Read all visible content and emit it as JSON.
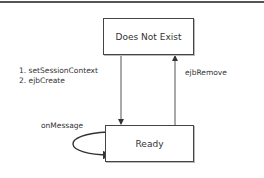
{
  "diagram": {
    "type": "state-diagram",
    "states": [
      {
        "id": "does-not-exist",
        "label": "Does Not Exist"
      },
      {
        "id": "ready",
        "label": "Ready"
      }
    ],
    "transitions": [
      {
        "from": "does-not-exist",
        "to": "ready",
        "labels": [
          "1. setSessionContext",
          "2. ejbCreate"
        ]
      },
      {
        "from": "ready",
        "to": "does-not-exist",
        "labels": [
          "ejbRemove"
        ]
      },
      {
        "from": "ready",
        "to": "ready",
        "labels": [
          "onMessage"
        ]
      }
    ]
  },
  "colors": {
    "line": "#444444",
    "text": "#333333",
    "background": "#ffffff"
  }
}
